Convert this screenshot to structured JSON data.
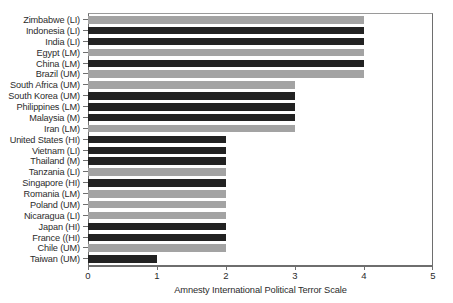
{
  "chart_data": {
    "type": "bar",
    "orientation": "horizontal",
    "title": "",
    "xlabel": "Amnesty International Political Terror Scale",
    "ylabel": "",
    "xlim": [
      0,
      5
    ],
    "xticks": [
      0,
      1,
      2,
      3,
      4,
      5
    ],
    "xticklabels": [
      "0",
      "1",
      "2",
      "3",
      "4",
      "5"
    ],
    "grid": false,
    "legend": null,
    "colors": {
      "dark": "#222222",
      "light": "#a3a3a3",
      "axis": "#6e6e6e",
      "text": "#2b2b2b"
    },
    "categories": [
      "Zimbabwe (LI)",
      "Indonesia (LI)",
      "India (LI)",
      "Egypt (LM)",
      "China (LM)",
      "Brazil (UM)",
      "South Africa (UM)",
      "South Korea (UM)",
      "Philippines (LM)",
      "Malaysia (M)",
      "Iran (LM)",
      "United States (HI)",
      "Vietnam (LI)",
      "Thailand (M)",
      "Tanzania (LI)",
      "Singapore (HI)",
      "Romania (LM)",
      "Poland (UM)",
      "Nicaragua (LI)",
      "Japan (HI)",
      "France ((HI)",
      "Chile (UM)",
      "Taiwan (UM)"
    ],
    "values": [
      4,
      4,
      4,
      4,
      4,
      4,
      3,
      3,
      3,
      3,
      3,
      2,
      2,
      2,
      2,
      2,
      2,
      2,
      2,
      2,
      2,
      2,
      1
    ],
    "bar_shades": [
      "light",
      "dark",
      "dark",
      "light",
      "dark",
      "light",
      "light",
      "dark",
      "dark",
      "dark",
      "light",
      "dark",
      "dark",
      "dark",
      "light",
      "dark",
      "light",
      "light",
      "light",
      "dark",
      "dark",
      "light",
      "dark"
    ]
  }
}
